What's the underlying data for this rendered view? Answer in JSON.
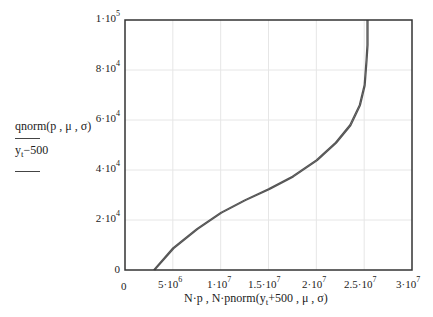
{
  "chart_data": {
    "type": "line",
    "title": "",
    "xlabel": "N·p, N·pnorm(y_t+500, μ, σ)",
    "ylabel": [
      "qnorm(p, μ, σ)",
      "y_t−500"
    ],
    "xlim": [
      0,
      30000000
    ],
    "ylim": [
      0,
      100000
    ],
    "grid": true,
    "x_ticks": [
      "0",
      "5·10^6",
      "1·10^7",
      "1.5·10^7",
      "2·10^7",
      "2.5·10^7",
      "3·10^7"
    ],
    "y_ticks": [
      "0",
      "2·10^4",
      "4·10^4",
      "6·10^4",
      "8·10^4",
      "1·10^5"
    ],
    "series": [
      {
        "name": "qnorm(p, μ, σ)",
        "x": [
          3000000,
          5000000,
          7500000,
          10000000,
          12500000,
          15000000,
          17500000,
          20000000,
          22000000,
          23500000,
          24500000,
          25000000,
          25200000,
          25300000,
          25300000
        ],
        "y": [
          0,
          8800,
          16500,
          23000,
          28000,
          32500,
          37500,
          44000,
          51000,
          58000,
          66000,
          74000,
          84000,
          90000,
          100000
        ]
      },
      {
        "name": "y_t−500",
        "x": [
          3100000,
          5100000,
          7600000,
          10100000,
          12600000,
          15100000,
          17600000,
          20100000,
          22100000,
          23600000,
          24600000,
          25100000,
          25300000,
          25400000,
          25400000
        ],
        "y": [
          0,
          8600,
          16300,
          22800,
          27800,
          32300,
          37300,
          43800,
          50800,
          57800,
          65800,
          73800,
          83800,
          90000,
          100000
        ]
      }
    ],
    "legend": [
      "qnorm(p, μ, σ)",
      "y_t−500"
    ]
  },
  "labels": {
    "y_tick_0": "0",
    "y_tick_1_base": "2·10",
    "y_tick_2_base": "4·10",
    "y_tick_3_base": "6·10",
    "y_tick_4_base": "8·10",
    "y_tick_5_base": "1·10",
    "y_exp_4": "4",
    "y_exp_5": "5",
    "x_tick_0": "0",
    "x_tick_1_base": "5·10",
    "x_tick_1_exp": "6",
    "x_tick_2_base": "1·10",
    "x_tick_3_base": "1.5·10",
    "x_tick_4_base": "2·10",
    "x_tick_5_base": "2.5·10",
    "x_tick_6_base": "3·10",
    "x_exp_7": "7",
    "ylabel_1": "qnorm(p , μ , σ)",
    "ylabel_2_pre": "y",
    "ylabel_2_sub": "t",
    "ylabel_2_post": "−500",
    "xlabel_pre": "N·p , N·pnorm(y",
    "xlabel_sub": "t",
    "xlabel_post": "+500 , μ , σ)"
  },
  "colors": {
    "frame": "#333333",
    "grid": "#e6e6e6",
    "series": "#555555"
  }
}
